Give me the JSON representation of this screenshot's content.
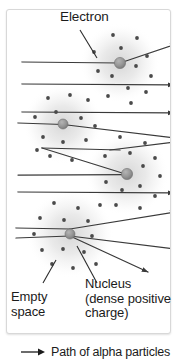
{
  "figure": {
    "panel": {
      "border_color": "#d8d8d8",
      "background": "#ffffff"
    },
    "labels": {
      "electron": "Electron",
      "empty_space": "Empty\nspace",
      "nucleus": "Nucleus\n(dense positive\ncharge)"
    },
    "legend": {
      "arrow_icon": "right-arrow-icon",
      "text": "Path of alpha particles"
    },
    "colors": {
      "ray": "#3a3a3a",
      "electron_dot": "#4a4a4a",
      "nucleus_fill": "#9a9a9a",
      "nucleus_stroke": "#6e6e6e",
      "cloud": "#c9c9c9",
      "text": "#1b1b1b"
    },
    "atoms": [
      {
        "id": "atom-1",
        "cx": 120,
        "cy": 63,
        "cloud_r": 40,
        "nucleus_r": 5.5
      },
      {
        "id": "atom-2",
        "cx": 63,
        "cy": 124,
        "cloud_r": 40,
        "nucleus_r": 5.0
      },
      {
        "id": "atom-3",
        "cx": 127,
        "cy": 174,
        "cloud_r": 42,
        "nucleus_r": 5.5
      },
      {
        "id": "atom-4",
        "cx": 70,
        "cy": 234,
        "cloud_r": 44,
        "nucleus_r": 5.0
      }
    ],
    "ray_count": 10,
    "electron_count": 48
  }
}
